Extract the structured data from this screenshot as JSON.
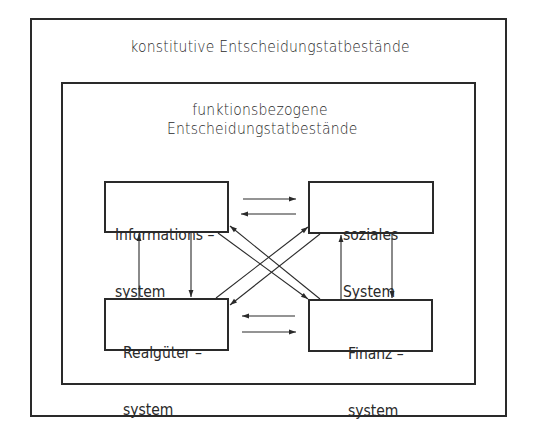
{
  "outer": {
    "title": "konstitutive  Entscheidungstatbestände"
  },
  "inner": {
    "title_line1": "funktionsbezogene",
    "title_line2": "Entscheidungstatbestände"
  },
  "systems": {
    "information": {
      "line1": "Informations –",
      "line2": "system"
    },
    "social": {
      "line1": "soziales",
      "line2": "System"
    },
    "real_goods": {
      "line1": "Realgüter –",
      "line2": "system"
    },
    "finance": {
      "line1": "Finanz –",
      "line2": "system"
    }
  },
  "colors": {
    "stroke": "#2a2a2a",
    "background": "#ffffff"
  }
}
